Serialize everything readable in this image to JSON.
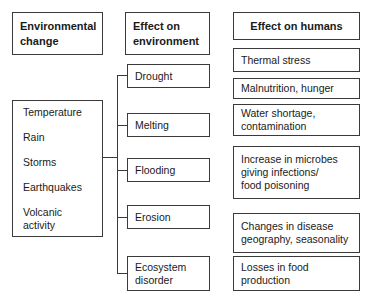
{
  "headers": {
    "environmental_change": "Environmental\nchange",
    "effect_on_environment": "Effect on\nenvironment",
    "effect_on_humans": "Effect on humans"
  },
  "environmental_changes": [
    "Temperature",
    "Rain",
    "Storms",
    "Earthquakes",
    "Volcanic activity"
  ],
  "environment_effects": [
    {
      "label": "Drought"
    },
    {
      "label": "Melting"
    },
    {
      "label": "Flooding"
    },
    {
      "label": "Erosion"
    },
    {
      "label": "Ecosystem\ndisorder"
    }
  ],
  "human_effects": [
    {
      "label": "Thermal stress"
    },
    {
      "label": "Malnutrition, hunger"
    },
    {
      "label": "Water shortage,\ncontamination"
    },
    {
      "label": "Increase in microbes\ngiving infections/\nfood poisoning"
    },
    {
      "label": "Changes in disease\ngeography, seasonality"
    },
    {
      "label": "Losses in food\nproduction"
    }
  ]
}
